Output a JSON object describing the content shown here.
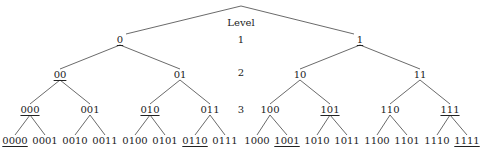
{
  "diagram": {
    "title": "Level",
    "line_color": "#444444",
    "text_color": "#222222",
    "root": {
      "x": 241,
      "y": 6
    },
    "levels": [
      {
        "label": "1",
        "y": 40,
        "nodes": [
          {
            "text": "0",
            "x": 120,
            "underlined": true
          },
          {
            "text": "1",
            "x": 360,
            "underlined": true
          }
        ]
      },
      {
        "label": "2",
        "y": 75,
        "nodes": [
          {
            "text": "00",
            "x": 60,
            "underlined": true
          },
          {
            "text": "01",
            "x": 180,
            "underlined": false
          },
          {
            "text": "10",
            "x": 300,
            "underlined": false
          },
          {
            "text": "11",
            "x": 420,
            "underlined": false
          }
        ]
      },
      {
        "label": "3",
        "y": 110,
        "nodes": [
          {
            "text": "000",
            "x": 30,
            "underlined": true
          },
          {
            "text": "001",
            "x": 90,
            "underlined": false
          },
          {
            "text": "010",
            "x": 150,
            "underlined": true
          },
          {
            "text": "011",
            "x": 210,
            "underlined": false
          },
          {
            "text": "100",
            "x": 270,
            "underlined": false
          },
          {
            "text": "101",
            "x": 330,
            "underlined": true
          },
          {
            "text": "110",
            "x": 390,
            "underlined": false
          },
          {
            "text": "111",
            "x": 450,
            "underlined": true
          }
        ]
      },
      {
        "label": "",
        "y": 141,
        "nodes": [
          {
            "text": "0000",
            "x": 15,
            "underlined": true
          },
          {
            "text": "0001",
            "x": 45,
            "underlined": false
          },
          {
            "text": "0010",
            "x": 75,
            "underlined": false
          },
          {
            "text": "0011",
            "x": 105,
            "underlined": false
          },
          {
            "text": "0100",
            "x": 135,
            "underlined": false
          },
          {
            "text": "0101",
            "x": 165,
            "underlined": false
          },
          {
            "text": "0110",
            "x": 195,
            "underlined": true
          },
          {
            "text": "0111",
            "x": 225,
            "underlined": false
          },
          {
            "text": "1000",
            "x": 257,
            "underlined": false
          },
          {
            "text": "1001",
            "x": 287,
            "underlined": true
          },
          {
            "text": "1010",
            "x": 317,
            "underlined": false
          },
          {
            "text": "1011",
            "x": 347,
            "underlined": false
          },
          {
            "text": "1100",
            "x": 377,
            "underlined": false
          },
          {
            "text": "1101",
            "x": 407,
            "underlined": false
          },
          {
            "text": "1110",
            "x": 437,
            "underlined": false
          },
          {
            "text": "1111",
            "x": 467,
            "underlined": true
          }
        ]
      }
    ],
    "level_labels": [
      {
        "text": "Level",
        "x": 241,
        "y": 23
      },
      {
        "text": "1",
        "x": 241,
        "y": 40
      },
      {
        "text": "2",
        "x": 241,
        "y": 73
      },
      {
        "text": "3",
        "x": 241,
        "y": 110
      }
    ]
  }
}
